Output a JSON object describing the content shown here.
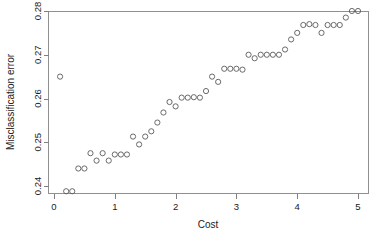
{
  "chart_data": {
    "type": "scatter",
    "title": "",
    "xlabel": "Cost",
    "ylabel": "Misclassification error",
    "xlim": [
      0,
      5.2
    ],
    "ylim": [
      0.2355,
      0.2805
    ],
    "grid": false,
    "legend": null,
    "x_ticks": [
      0,
      1,
      2,
      3,
      4,
      5
    ],
    "x_tick_labels": [
      "0",
      "1",
      "2",
      "3",
      "4",
      "5"
    ],
    "y_ticks": [
      0.24,
      0.25,
      0.26,
      0.27,
      0.28
    ],
    "y_tick_labels": [
      "0.24",
      "0.25",
      "0.26",
      "0.27",
      "0.28"
    ],
    "marker": "open-circle",
    "marker_color": "#5a5a5a",
    "x": [
      0.1,
      0.2,
      0.3,
      0.4,
      0.5,
      0.6,
      0.7,
      0.8,
      0.9,
      1.0,
      1.1,
      1.2,
      1.3,
      1.4,
      1.5,
      1.6,
      1.7,
      1.8,
      1.9,
      2.0,
      2.1,
      2.2,
      2.3,
      2.4,
      2.5,
      2.6,
      2.7,
      2.8,
      2.9,
      3.0,
      3.1,
      3.2,
      3.3,
      3.4,
      3.5,
      3.6,
      3.7,
      3.8,
      3.9,
      4.0,
      4.1,
      4.2,
      4.3,
      4.4,
      4.5,
      4.6,
      4.7,
      4.8,
      4.9,
      5.0
    ],
    "y": [
      0.265,
      0.2388,
      0.2388,
      0.244,
      0.244,
      0.2475,
      0.2458,
      0.2475,
      0.2458,
      0.2472,
      0.2472,
      0.2472,
      0.2513,
      0.2495,
      0.2513,
      0.2525,
      0.2545,
      0.2568,
      0.2592,
      0.2582,
      0.2602,
      0.2602,
      0.2603,
      0.2602,
      0.2617,
      0.265,
      0.2638,
      0.2668,
      0.2668,
      0.2668,
      0.2666,
      0.27,
      0.2692,
      0.27,
      0.27,
      0.27,
      0.27,
      0.2712,
      0.2735,
      0.275,
      0.2768,
      0.277,
      0.2768,
      0.275,
      0.2768,
      0.2768,
      0.2768,
      0.2785,
      0.28,
      0.28
    ],
    "series_name": "misclassification error vs cost",
    "n_points": 50
  },
  "axes": {
    "x_label": "Cost",
    "y_label": "Misclassification error"
  }
}
